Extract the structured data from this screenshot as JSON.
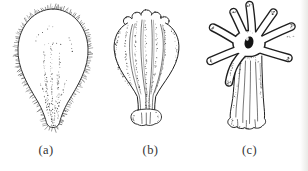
{
  "canvas": {
    "background": "#ffffff",
    "ink_color": "#1f1f1f",
    "stipple_color": "#2b2b2b",
    "edge_shade_color": "#e9e9e6"
  },
  "panels": [
    {
      "label": "(a)",
      "icon": "planula-larva-drawing"
    },
    {
      "label": "(b)",
      "icon": "settled-larva-lobed-bud-drawing"
    },
    {
      "label": "(c)",
      "icon": "young-scyphistoma-polyp-drawing"
    }
  ]
}
